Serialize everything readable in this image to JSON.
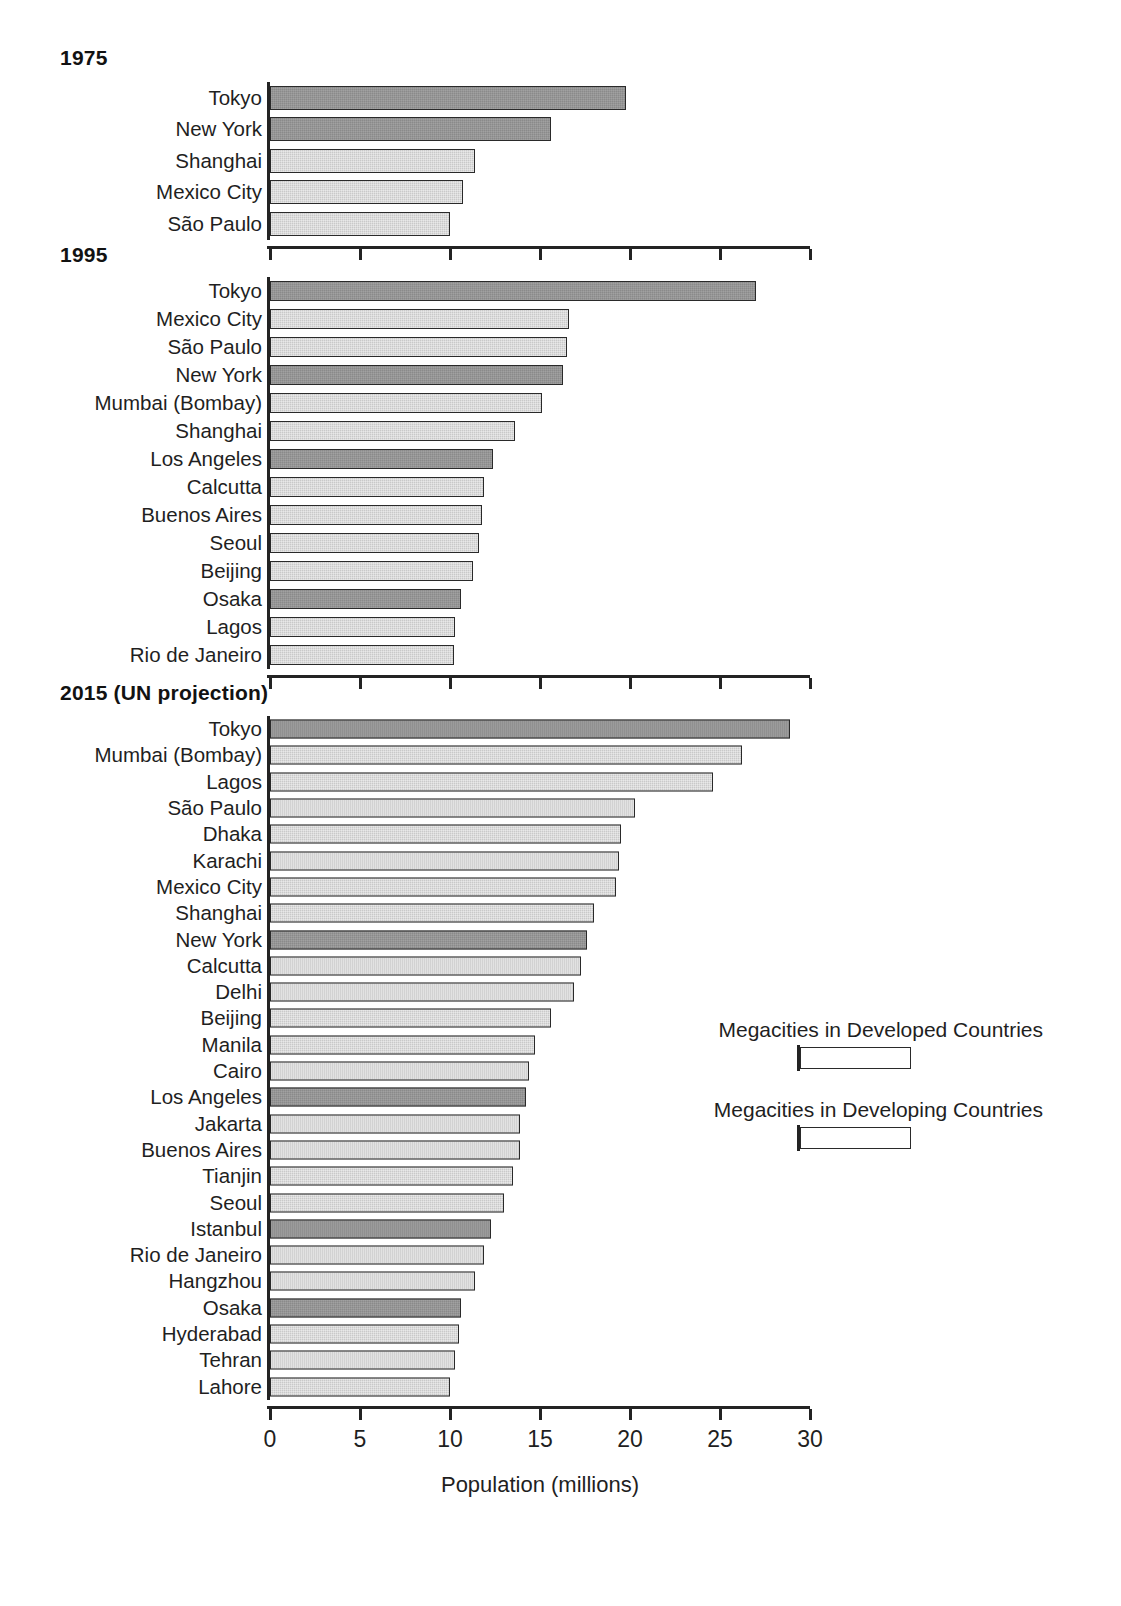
{
  "axis": {
    "xlabel": "Population (millions)",
    "ticks": [
      "0",
      "5",
      "10",
      "15",
      "20",
      "25",
      "30"
    ],
    "xmin": 0,
    "xmax": 30
  },
  "legend": {
    "position": "middle-right",
    "entries": [
      {
        "label": "Megacities in Developed Countries",
        "swatch": "developed",
        "color": "#8a8a8a"
      },
      {
        "label": "Megacities in Developing Countries",
        "swatch": "developing",
        "color": "#c9c9c9"
      }
    ]
  },
  "panels": [
    {
      "title": "1975"
    },
    {
      "title": "1995"
    },
    {
      "title": "2015 (UN projection)"
    }
  ],
  "chart_data": {
    "type": "bar",
    "orientation": "horizontal",
    "title": "",
    "xlabel": "Population (millions)",
    "ylabel": "",
    "xlim": [
      0,
      30
    ],
    "xticks": [
      0,
      5,
      10,
      15,
      20,
      25,
      30
    ],
    "grid": false,
    "legend": {
      "position": "middle-right",
      "entries": [
        "Megacities in Developed Countries",
        "Megacities in Developing Countries"
      ]
    },
    "panels": [
      {
        "title": "1975",
        "categories": [
          "Tokyo",
          "New York",
          "Shanghai",
          "Mexico City",
          "São Paulo"
        ],
        "values": [
          19.8,
          15.6,
          11.4,
          10.7,
          10.0
        ],
        "groups": [
          "developed",
          "developed",
          "developing",
          "developing",
          "developing"
        ]
      },
      {
        "title": "1995",
        "categories": [
          "Tokyo",
          "Mexico City",
          "São Paulo",
          "New York",
          "Mumbai (Bombay)",
          "Shanghai",
          "Los Angeles",
          "Calcutta",
          "Buenos Aires",
          "Seoul",
          "Beijing",
          "Osaka",
          "Lagos",
          "Rio de Janeiro"
        ],
        "values": [
          27.0,
          16.6,
          16.5,
          16.3,
          15.1,
          13.6,
          12.4,
          11.9,
          11.8,
          11.6,
          11.3,
          10.6,
          10.3,
          10.2
        ],
        "groups": [
          "developed",
          "developing",
          "developing",
          "developed",
          "developing",
          "developing",
          "developed",
          "developing",
          "developing",
          "developing",
          "developing",
          "developed",
          "developing",
          "developing"
        ]
      },
      {
        "title": "2015 (UN projection)",
        "categories": [
          "Tokyo",
          "Mumbai (Bombay)",
          "Lagos",
          "São Paulo",
          "Dhaka",
          "Karachi",
          "Mexico City",
          "Shanghai",
          "New York",
          "Calcutta",
          "Delhi",
          "Beijing",
          "Manila",
          "Cairo",
          "Los Angeles",
          "Jakarta",
          "Buenos Aires",
          "Tianjin",
          "Seoul",
          "Istanbul",
          "Rio de Janeiro",
          "Hangzhou",
          "Osaka",
          "Hyderabad",
          "Tehran",
          "Lahore"
        ],
        "values": [
          28.9,
          26.2,
          24.6,
          20.3,
          19.5,
          19.4,
          19.2,
          18.0,
          17.6,
          17.3,
          16.9,
          15.6,
          14.7,
          14.4,
          14.2,
          13.9,
          13.9,
          13.5,
          13.0,
          12.3,
          11.9,
          11.4,
          10.6,
          10.5,
          10.3,
          10.0
        ],
        "groups": [
          "developed",
          "developing",
          "developing",
          "developing",
          "developing",
          "developing",
          "developing",
          "developing",
          "developed",
          "developing",
          "developing",
          "developing",
          "developing",
          "developing",
          "developed",
          "developing",
          "developing",
          "developing",
          "developing",
          "developed",
          "developing",
          "developing",
          "developed",
          "developing",
          "developing",
          "developing"
        ]
      }
    ]
  }
}
